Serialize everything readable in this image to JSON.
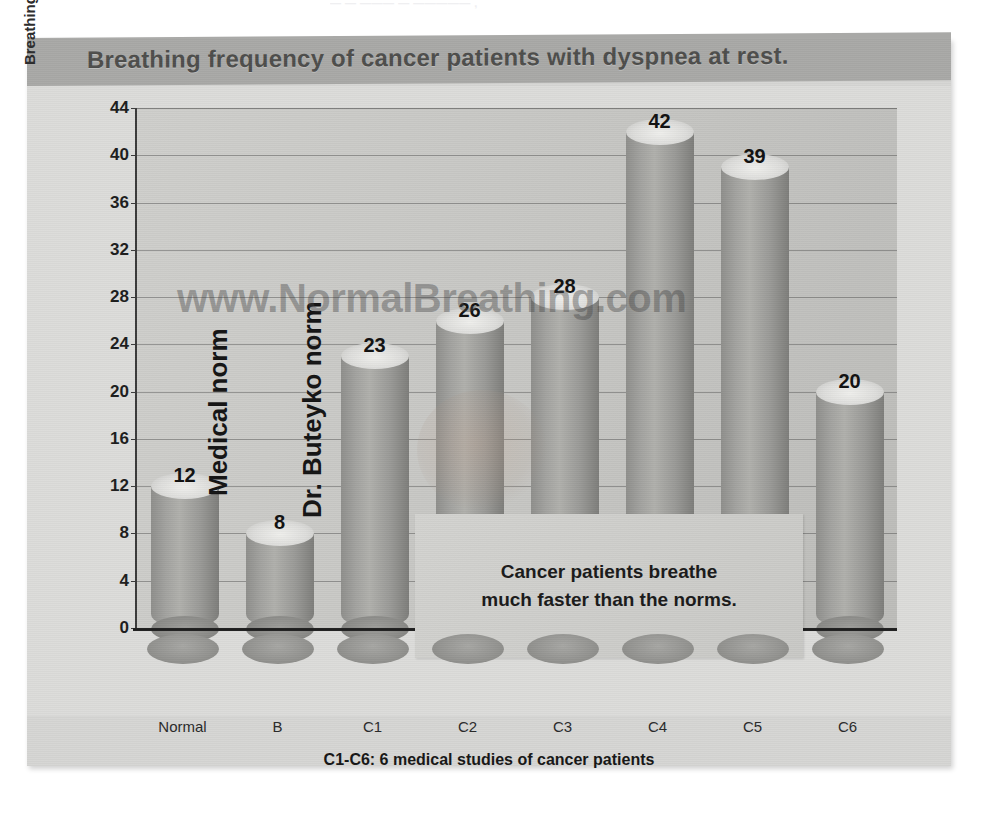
{
  "page": {
    "clipped_top_text": "— — ——— —  ————— ,"
  },
  "chart_data": {
    "type": "bar",
    "title": "Breathing frequency of cancer patients with dyspnea at rest.",
    "xlabel": "C1-C6: 6 medical studies of cancer patients",
    "ylabel": "Breathing frequency, breaths/min",
    "categories": [
      "Normal",
      "B",
      "C1",
      "C2",
      "C3",
      "C4",
      "C5",
      "C6"
    ],
    "values": [
      12,
      8,
      23,
      26,
      28,
      42,
      39,
      20
    ],
    "ylim": [
      0,
      44
    ],
    "ytick_step": 4,
    "yticks": [
      0,
      4,
      8,
      12,
      16,
      20,
      24,
      28,
      32,
      36,
      40,
      44
    ],
    "grid": true,
    "legend": "none",
    "annotations": [
      {
        "text": "Medical norm",
        "orientation": "vertical",
        "near_category": "Normal"
      },
      {
        "text": "Dr. Buteyko norm",
        "orientation": "vertical",
        "near_category": "B"
      },
      {
        "text": "Cancer patients breathe\nmuch faster than the norms.",
        "orientation": "horizontal",
        "kind": "callout"
      }
    ],
    "watermark": "www.NormalBreathing.com",
    "colors": {
      "plot_background": "#c9c9c6",
      "slide_background": "#d6d6d4",
      "title_band": "#a9a9a7",
      "bar_fill": "#a3a3a0",
      "axis": "#1f1f1f",
      "value_label": "#111111"
    }
  },
  "callout": {
    "line1": "Cancer patients breathe",
    "line2": "much faster than the norms."
  },
  "notes": {
    "medical_norm": "Medical norm",
    "buteyko_norm": "Dr. Buteyko norm"
  }
}
